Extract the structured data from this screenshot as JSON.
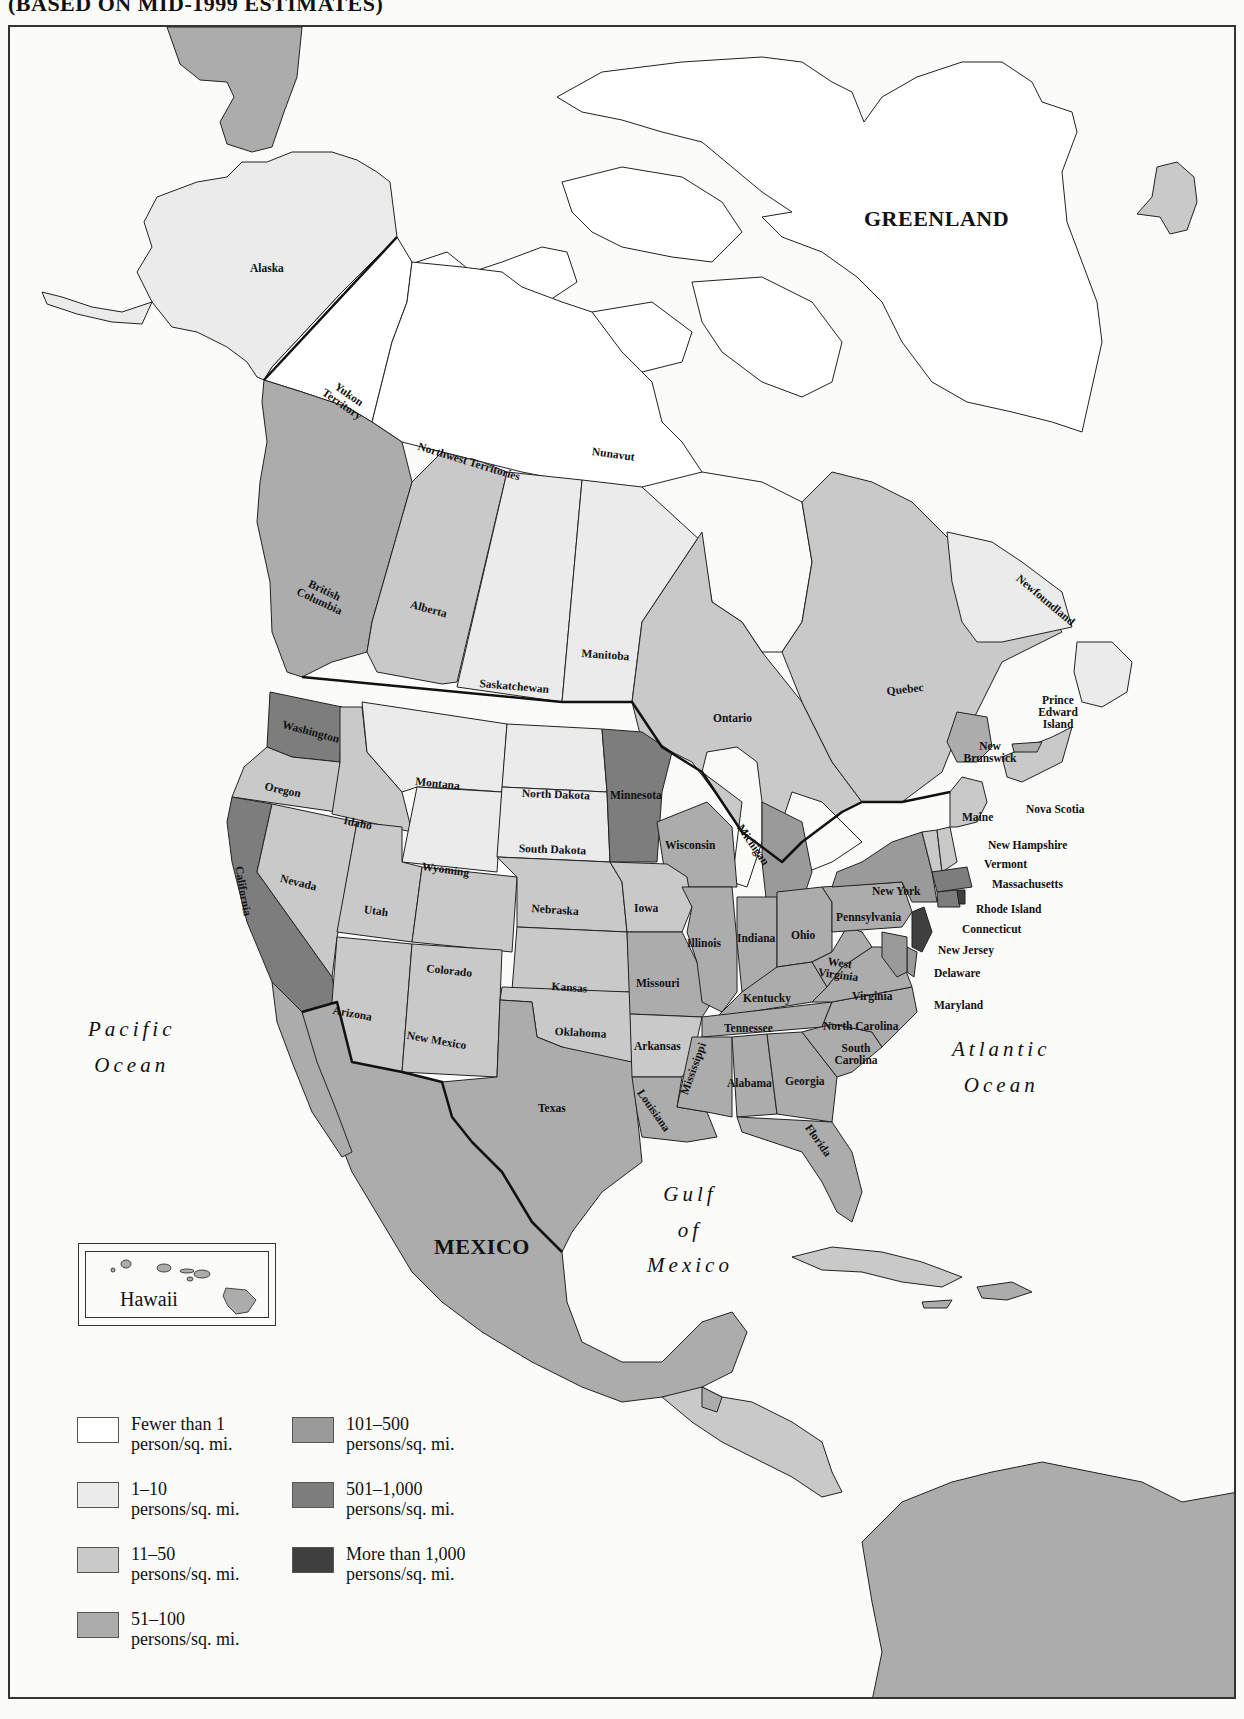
{
  "map": {
    "title": "(BASED ON MID-1999 ESTIMATES)",
    "subject": "Population density of North America",
    "colors": {
      "lt1": "#ffffff",
      "d1_10": "#ebebeb",
      "d11_50": "#c9c9c9",
      "d51_100": "#acacac",
      "d101_500": "#9a9a9a",
      "d501_1000": "#7d7d7d",
      "gt1000": "#3f3f3f",
      "water": "#fbfbfa",
      "border": "#222222"
    },
    "regions": {
      "greenland": "GREENLAND",
      "mexico": "MEXICO",
      "alaska": "Alaska",
      "yukon": "Yukon Territory",
      "nwt": "Northwest Territories",
      "nunavut": "Nunavut",
      "bc": "British Columbia",
      "alberta": "Alberta",
      "saskatchewan": "Saskatchewan",
      "manitoba": "Manitoba",
      "ontario": "Ontario",
      "quebec": "Quebec",
      "newfoundland": "Newfoundland",
      "pei": "Prince Edward Island",
      "new_brunswick": "New Brunswick",
      "nova_scotia": "Nova Scotia",
      "washington": "Washington",
      "oregon": "Oregon",
      "california": "California",
      "idaho": "Idaho",
      "nevada": "Nevada",
      "montana": "Montana",
      "wyoming": "Wyoming",
      "utah": "Utah",
      "colorado": "Colorado",
      "arizona": "Arizona",
      "new_mexico": "New Mexico",
      "north_dakota": "North Dakota",
      "south_dakota": "South Dakota",
      "nebraska": "Nebraska",
      "kansas": "Kansas",
      "oklahoma": "Oklahoma",
      "texas": "Texas",
      "minnesota": "Minnesota",
      "iowa": "Iowa",
      "missouri": "Missouri",
      "arkansas": "Arkansas",
      "louisiana": "Louisiana",
      "wisconsin": "Wisconsin",
      "michigan": "Michigan",
      "illinois": "Illinois",
      "indiana": "Indiana",
      "ohio": "Ohio",
      "kentucky": "Kentucky",
      "tennessee": "Tennessee",
      "mississippi": "Mississippi",
      "alabama": "Alabama",
      "georgia": "Georgia",
      "florida": "Florida",
      "south_carolina": "South Carolina",
      "north_carolina": "North Carolina",
      "virginia": "Virginia",
      "west_virginia": "West Virginia",
      "pennsylvania": "Pennsylvania",
      "new_york": "New York",
      "maine": "Maine",
      "new_hampshire": "New Hampshire",
      "vermont": "Vermont",
      "massachusetts": "Massachusetts",
      "rhode_island": "Rhode Island",
      "connecticut": "Connecticut",
      "new_jersey": "New Jersey",
      "delaware": "Delaware",
      "maryland": "Maryland"
    },
    "oceans": {
      "pacific_1": "Pacific",
      "pacific_2": "Ocean",
      "atlantic_1": "Atlantic",
      "atlantic_2": "Ocean",
      "gulf_1": "Gulf",
      "gulf_2": "of",
      "gulf_3": "Mexico"
    },
    "inset": {
      "label": "Hawaii"
    }
  },
  "legend": {
    "items": [
      {
        "line1": "Fewer than 1",
        "line2": "person/sq. mi.",
        "color": "#ffffff"
      },
      {
        "line1": "1–10",
        "line2": "persons/sq. mi.",
        "color": "#ebebeb"
      },
      {
        "line1": "11–50",
        "line2": "persons/sq. mi.",
        "color": "#c9c9c9"
      },
      {
        "line1": "51–100",
        "line2": "persons/sq. mi.",
        "color": "#acacac"
      },
      {
        "line1": "101–500",
        "line2": "persons/sq. mi.",
        "color": "#9a9a9a"
      },
      {
        "line1": "501–1,000",
        "line2": "persons/sq. mi.",
        "color": "#7d7d7d"
      },
      {
        "line1": "More than 1,000",
        "line2": "persons/sq. mi.",
        "color": "#3f3f3f"
      }
    ]
  }
}
